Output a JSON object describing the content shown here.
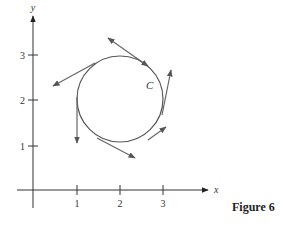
{
  "figure": {
    "caption": "Figure 6",
    "curve_label": "C",
    "x_axis_label": "x",
    "y_axis_label": "y",
    "x_ticks": [
      "1",
      "2",
      "3"
    ],
    "y_ticks": [
      "1",
      "2",
      "3"
    ]
  },
  "colors": {
    "curve": "#555555",
    "axes": "#333333",
    "arrows": "#666666"
  }
}
